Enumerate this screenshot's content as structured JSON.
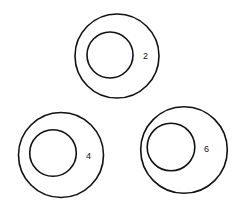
{
  "diagram": {
    "type": "concentric-circles",
    "stroke_color": "#111111",
    "background": "#ffffff",
    "figures": [
      {
        "id": "figure-2",
        "label": "2",
        "outer": {
          "cx": 117,
          "cy": 56,
          "r": 42
        },
        "inner": {
          "cx": 110,
          "cy": 55,
          "r": 23
        },
        "label_pos": {
          "x": 143,
          "y": 59
        }
      },
      {
        "id": "figure-4",
        "label": "4",
        "outer": {
          "cx": 61,
          "cy": 155,
          "r": 42.5
        },
        "inner": {
          "cx": 53,
          "cy": 153,
          "r": 23.3
        },
        "label_pos": {
          "x": 86,
          "y": 159
        }
      },
      {
        "id": "figure-6",
        "label": "6",
        "outer": {
          "cx": 184,
          "cy": 150,
          "r": 43.3
        },
        "inner": {
          "cx": 171,
          "cy": 147,
          "r": 23.8
        },
        "label_pos": {
          "x": 204,
          "y": 152
        }
      }
    ]
  }
}
